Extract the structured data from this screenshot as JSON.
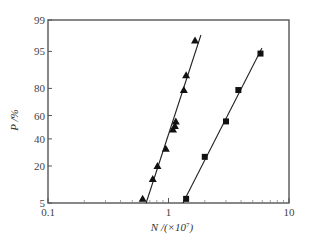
{
  "chart_data": {
    "type": "scatter",
    "title": "",
    "xlabel": "N /(×10⁷)",
    "ylabel": "P /%",
    "xscale": "log",
    "yscale": "probability",
    "xlim": [
      0.1,
      10
    ],
    "ylim": [
      5,
      99
    ],
    "x_ticks": [
      "0.1",
      "1",
      "10"
    ],
    "y_ticks": [
      "5",
      "20",
      "40",
      "60",
      "80",
      "95",
      "99"
    ],
    "grid": false,
    "legend": null,
    "series": [
      {
        "name": "triangles",
        "marker": "triangle",
        "fit_line": true,
        "points": [
          {
            "x": 0.61,
            "y": 6
          },
          {
            "x": 0.74,
            "y": 13
          },
          {
            "x": 0.81,
            "y": 20
          },
          {
            "x": 0.95,
            "y": 32
          },
          {
            "x": 1.09,
            "y": 48
          },
          {
            "x": 1.13,
            "y": 51
          },
          {
            "x": 1.15,
            "y": 55
          },
          {
            "x": 1.34,
            "y": 79
          },
          {
            "x": 1.4,
            "y": 87
          },
          {
            "x": 1.66,
            "y": 97
          }
        ]
      },
      {
        "name": "squares",
        "marker": "square",
        "fit_line": true,
        "points": [
          {
            "x": 1.4,
            "y": 6
          },
          {
            "x": 2.0,
            "y": 26
          },
          {
            "x": 3.0,
            "y": 55
          },
          {
            "x": 3.8,
            "y": 79
          },
          {
            "x": 5.8,
            "y": 94.5
          }
        ]
      }
    ]
  },
  "axes": {
    "xlabel_main": "N /(×10",
    "xlabel_sup": "7",
    "xlabel_close": ")",
    "ylabel": "P /%"
  }
}
